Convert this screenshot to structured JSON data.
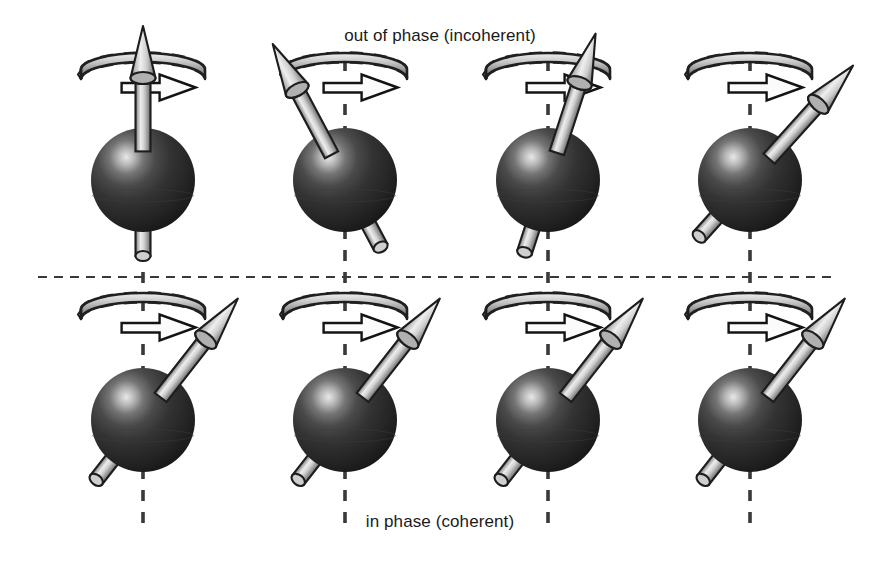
{
  "figure": {
    "title_top": "out of phase (incoherent)",
    "title_bottom": "in phase (coherent)",
    "background_color": "#ffffff",
    "sphere_color": "#2b2b2b",
    "sphere_highlight_color": "#f2f2f2",
    "arrow_color": "#c8c8c8",
    "axis_color": "#3a3a3a",
    "divider_color": "#3a3a3a",
    "text_color": "#1a1a1a"
  },
  "chart_data": {
    "type": "diagram",
    "rows": [
      {
        "name": "out-of-phase",
        "label": "out of phase (incoherent)",
        "label_position": "top",
        "coherent": false,
        "row_center_y": 180,
        "spins": [
          {
            "index": 1,
            "axis_x": 143,
            "tilt_deg": 0,
            "phase_deg": 0,
            "description": "spin aligned with vertical axis"
          },
          {
            "index": 2,
            "axis_x": 345,
            "tilt_deg": -28,
            "phase_deg": 180,
            "description": "spin tilted to upper left"
          },
          {
            "index": 3,
            "axis_x": 548,
            "tilt_deg": 18,
            "phase_deg": 20,
            "description": "spin tilted slightly to upper right"
          },
          {
            "index": 4,
            "axis_x": 750,
            "tilt_deg": 42,
            "phase_deg": 60,
            "description": "spin tilted strongly to upper right"
          }
        ]
      },
      {
        "name": "in-phase",
        "label": "in phase (coherent)",
        "label_position": "bottom",
        "coherent": true,
        "row_center_y": 420,
        "spins": [
          {
            "index": 1,
            "axis_x": 143,
            "tilt_deg": 38,
            "phase_deg": 45,
            "description": "spin tilted to upper right"
          },
          {
            "index": 2,
            "axis_x": 345,
            "tilt_deg": 38,
            "phase_deg": 45,
            "description": "spin tilted to upper right"
          },
          {
            "index": 3,
            "axis_x": 548,
            "tilt_deg": 38,
            "phase_deg": 45,
            "description": "spin tilted to upper right"
          },
          {
            "index": 4,
            "axis_x": 750,
            "tilt_deg": 38,
            "phase_deg": 45,
            "description": "spin tilted to upper right"
          }
        ]
      }
    ],
    "divider": {
      "y": 277,
      "x_start": 38,
      "x_end": 838,
      "style": "dashed"
    },
    "elements": {
      "sphere_radius": 52,
      "arrow_length": 108,
      "precession_ellipse_rx": 62,
      "precession_ellipse_ry": 17,
      "precession_direction": "clockwise viewed from above"
    }
  }
}
